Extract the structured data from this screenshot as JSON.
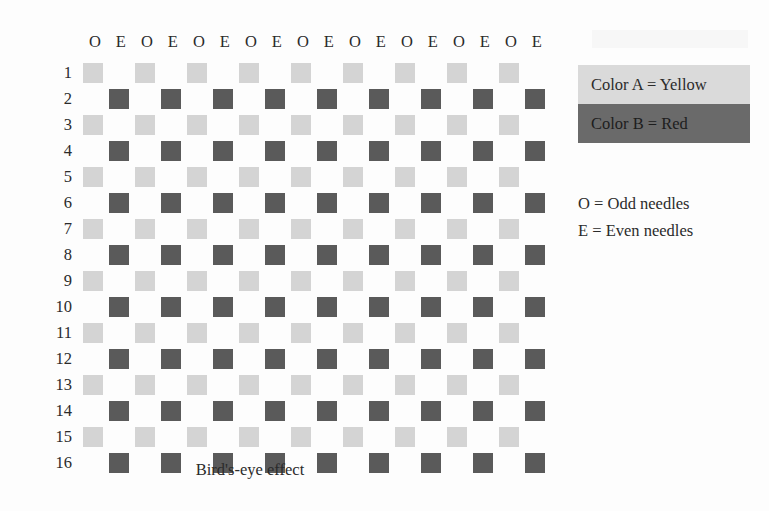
{
  "colors": {
    "color_a_swatch": "#d4d4d4",
    "color_b_swatch": "#5a5a5a",
    "legend_a_background": "#dadada",
    "legend_b_background": "#6a6a6a",
    "page_background": "#fdfdfd",
    "text": "#2b2b2b"
  },
  "chart_data": {
    "type": "heatmap",
    "title": "Bird's-eye effect",
    "xlabel": "",
    "ylabel": "",
    "grid": false,
    "legend_position": "right",
    "columns": 18,
    "rows": 16,
    "column_headers": [
      "O",
      "E",
      "O",
      "E",
      "O",
      "E",
      "O",
      "E",
      "O",
      "E",
      "O",
      "E",
      "O",
      "E",
      "O",
      "E",
      "O",
      "E"
    ],
    "row_labels": [
      "1",
      "2",
      "3",
      "4",
      "5",
      "6",
      "7",
      "8",
      "9",
      "10",
      "11",
      "12",
      "13",
      "14",
      "15",
      "16"
    ],
    "value_legend": {
      "A": "Color A = Yellow (light swatch)",
      "B": "Color B = Red (dark swatch)",
      "": "empty / no stitch shown"
    },
    "cells": [
      [
        "A",
        "",
        "A",
        "",
        "A",
        "",
        "A",
        "",
        "A",
        "",
        "A",
        "",
        "A",
        "",
        "A",
        "",
        "A",
        ""
      ],
      [
        "",
        "B",
        "",
        "B",
        "",
        "B",
        "",
        "B",
        "",
        "B",
        "",
        "B",
        "",
        "B",
        "",
        "B",
        "",
        "B"
      ],
      [
        "A",
        "",
        "A",
        "",
        "A",
        "",
        "A",
        "",
        "A",
        "",
        "A",
        "",
        "A",
        "",
        "A",
        "",
        "A",
        ""
      ],
      [
        "",
        "B",
        "",
        "B",
        "",
        "B",
        "",
        "B",
        "",
        "B",
        "",
        "B",
        "",
        "B",
        "",
        "B",
        "",
        "B"
      ],
      [
        "A",
        "",
        "A",
        "",
        "A",
        "",
        "A",
        "",
        "A",
        "",
        "A",
        "",
        "A",
        "",
        "A",
        "",
        "A",
        ""
      ],
      [
        "",
        "B",
        "",
        "B",
        "",
        "B",
        "",
        "B",
        "",
        "B",
        "",
        "B",
        "",
        "B",
        "",
        "B",
        "",
        "B"
      ],
      [
        "A",
        "",
        "A",
        "",
        "A",
        "",
        "A",
        "",
        "A",
        "",
        "A",
        "",
        "A",
        "",
        "A",
        "",
        "A",
        ""
      ],
      [
        "",
        "B",
        "",
        "B",
        "",
        "B",
        "",
        "B",
        "",
        "B",
        "",
        "B",
        "",
        "B",
        "",
        "B",
        "",
        "B"
      ],
      [
        "A",
        "",
        "A",
        "",
        "A",
        "",
        "A",
        "",
        "A",
        "",
        "A",
        "",
        "A",
        "",
        "A",
        "",
        "A",
        ""
      ],
      [
        "",
        "B",
        "",
        "B",
        "",
        "B",
        "",
        "B",
        "",
        "B",
        "",
        "B",
        "",
        "B",
        "",
        "B",
        "",
        "B"
      ],
      [
        "A",
        "",
        "A",
        "",
        "A",
        "",
        "A",
        "",
        "A",
        "",
        "A",
        "",
        "A",
        "",
        "A",
        "",
        "A",
        ""
      ],
      [
        "",
        "B",
        "",
        "B",
        "",
        "B",
        "",
        "B",
        "",
        "B",
        "",
        "B",
        "",
        "B",
        "",
        "B",
        "",
        "B"
      ],
      [
        "A",
        "",
        "A",
        "",
        "A",
        "",
        "A",
        "",
        "A",
        "",
        "A",
        "",
        "A",
        "",
        "A",
        "",
        "A",
        ""
      ],
      [
        "",
        "B",
        "",
        "B",
        "",
        "B",
        "",
        "B",
        "",
        "B",
        "",
        "B",
        "",
        "B",
        "",
        "B",
        "",
        "B"
      ],
      [
        "A",
        "",
        "A",
        "",
        "A",
        "",
        "A",
        "",
        "A",
        "",
        "A",
        "",
        "A",
        "",
        "A",
        "",
        "A",
        ""
      ],
      [
        "",
        "B",
        "",
        "B",
        "",
        "B",
        "",
        "B",
        "",
        "B",
        "",
        "B",
        "",
        "B",
        "",
        "B",
        "",
        "B"
      ]
    ]
  },
  "caption": "Bird's-eye effect",
  "legend": {
    "color_a_label": "Color A = Yellow",
    "color_b_label": "Color B = Red"
  },
  "needle_notes": [
    "O = Odd needles",
    "E = Even needles"
  ]
}
